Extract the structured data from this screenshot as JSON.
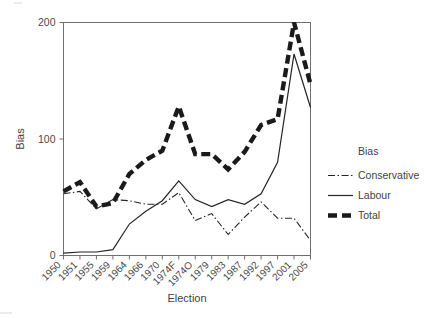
{
  "chart_data": {
    "type": "line",
    "title": "",
    "xlabel": "Election",
    "ylabel": "Bias",
    "ylim": [
      0,
      200
    ],
    "yticks": [
      0,
      100,
      200
    ],
    "ytick_labels": [
      "0",
      "100",
      "200"
    ],
    "grid": false,
    "legend_title": "Bias",
    "legend_position": "right",
    "categories": [
      "1950",
      "1951",
      "1955",
      "1959",
      "1964",
      "1966",
      "1970",
      "1974F",
      "1974O",
      "1979",
      "1983",
      "1987",
      "1992",
      "1997",
      "2001",
      "2005"
    ],
    "series": [
      {
        "name": "Conservative",
        "style": "dash-dot",
        "color": "#242424",
        "values": [
          53,
          55,
          40,
          48,
          47,
          44,
          44,
          54,
          30,
          36,
          18,
          33,
          46,
          32,
          32,
          13
        ]
      },
      {
        "name": "Labour",
        "style": "solid",
        "color": "#242424",
        "values": [
          2,
          3,
          3,
          5,
          27,
          38,
          47,
          64,
          48,
          42,
          48,
          44,
          53,
          80,
          173,
          127
        ]
      },
      {
        "name": "Total",
        "style": "thick-dashed",
        "color": "#1a1a1a",
        "values": [
          55,
          63,
          42,
          45,
          70,
          82,
          90,
          128,
          87,
          87,
          74,
          89,
          112,
          117,
          200,
          147
        ]
      }
    ]
  },
  "axes": {
    "y_title": "Bias",
    "x_title": "Election"
  },
  "legend": {
    "title": "Bias",
    "entries": [
      {
        "label": "Conservative",
        "swatch": "dash-dot-line-swatch"
      },
      {
        "label": "Labour",
        "swatch": "solid-line-swatch"
      },
      {
        "label": "Total",
        "swatch": "thick-dashed-line-swatch"
      }
    ]
  }
}
